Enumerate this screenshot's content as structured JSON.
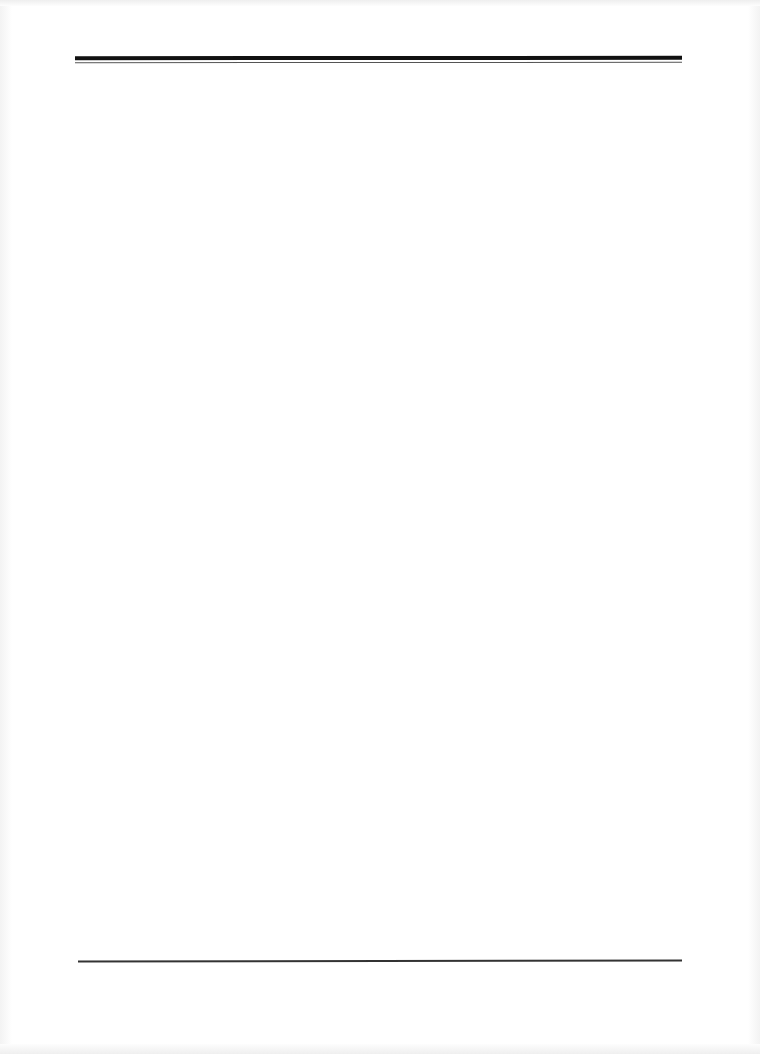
{
  "document": {
    "type": "blank-page",
    "header": {
      "rule_style": "double",
      "rule_color": "#111111"
    },
    "body": {
      "text": ""
    },
    "footer": {
      "rule_style": "single",
      "rule_color": "#333333"
    }
  }
}
